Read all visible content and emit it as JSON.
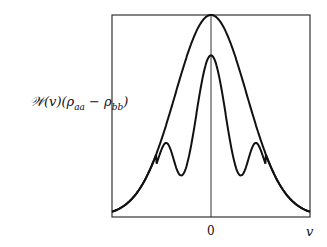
{
  "chart_data": {
    "type": "line",
    "title": "",
    "xlabel": "v",
    "ylabel": "𝒲(v)(ρaa − ρbb)",
    "x_ticks": [
      "0"
    ],
    "grid": false,
    "legend": null,
    "x": [
      -1.0,
      -0.8,
      -0.6,
      -0.43,
      -0.3,
      -0.2,
      -0.1,
      0,
      0.1,
      0.2,
      0.3,
      0.43,
      0.6,
      0.8,
      1.0
    ],
    "series": [
      {
        "name": "outer gaussian profile",
        "values": [
          0.03,
          0.12,
          0.3,
          0.52,
          0.7,
          0.84,
          0.96,
          1.0,
          0.96,
          0.84,
          0.7,
          0.52,
          0.3,
          0.12,
          0.03
        ]
      },
      {
        "name": "inner profile with side bumps",
        "values": [
          0.03,
          0.12,
          0.3,
          0.32,
          0.22,
          0.45,
          0.72,
          0.82,
          0.72,
          0.45,
          0.22,
          0.32,
          0.3,
          0.12,
          0.03
        ]
      }
    ],
    "xlim": [
      -1,
      1
    ],
    "ylim": [
      0,
      1
    ]
  },
  "labels": {
    "ylabel": "𝒲(v)(ρ",
    "ylabel_sub1": "aa",
    "ylabel_mid": " − ρ",
    "ylabel_sub2": "bb",
    "ylabel_end": ")",
    "xtick_zero": "0",
    "xlabel": "v"
  }
}
